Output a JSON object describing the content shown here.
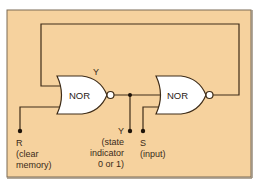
{
  "diagram": {
    "type": "logic-circuit",
    "colors": {
      "background": "#f6d29e",
      "border": "#7a6a55",
      "wire": "#3e2c18",
      "gate_fill": "#ffffff"
    },
    "gates": [
      {
        "id": "gate-1",
        "label": "NOR",
        "output_label": "Y"
      },
      {
        "id": "gate-2",
        "label": "NOR"
      }
    ],
    "terminals": {
      "r": {
        "name": "R",
        "desc_line1": "(clear",
        "desc_line2": "memory)"
      },
      "y": {
        "name": "Y",
        "desc_line1": "(state",
        "desc_line2": "indicator",
        "desc_line3": "0 or 1)"
      },
      "s": {
        "name": "S",
        "desc_line1": "(input)"
      }
    }
  }
}
